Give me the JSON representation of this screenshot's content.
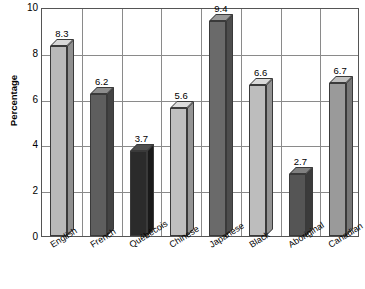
{
  "chart_data": {
    "type": "bar",
    "title": "",
    "subtitle": "",
    "xlabel": "",
    "ylabel": "Percentage",
    "ylim": [
      0,
      10
    ],
    "yticks": [
      0,
      2,
      4,
      6,
      8,
      10
    ],
    "ytick_labels": [
      "0",
      "2",
      "4",
      "6",
      "8",
      "10"
    ],
    "grid": "both",
    "legend": "none",
    "categories": [
      "English",
      "French",
      "Québécois",
      "Chinese",
      "Japanese",
      "Black",
      "Aboriginal",
      "Canadian"
    ],
    "values": [
      8.3,
      6.2,
      3.7,
      5.6,
      9.4,
      6.6,
      2.7,
      6.7
    ],
    "value_labels": [
      "8.3",
      "6.2",
      "3.7",
      "5.6",
      "9.4",
      "6.6",
      "2.7",
      "6.7"
    ],
    "bar_colors": [
      "#b9b9b9",
      "#5e5e5e",
      "#2b2b2b",
      "#bfbfbf",
      "#6a6a6a",
      "#bdbdbd",
      "#555555",
      "#9a9a9a"
    ],
    "bar_top_colors": [
      "#d8d8d8",
      "#8d8d8d",
      "#4f4f4f",
      "#dcdcdc",
      "#9a9a9a",
      "#dadada",
      "#808080",
      "#c0c0c0"
    ],
    "bar_side_colors": [
      "#8f8f8f",
      "#434343",
      "#1a1a1a",
      "#949494",
      "#4d4d4d",
      "#929292",
      "#3b3b3b",
      "#767676"
    ]
  }
}
